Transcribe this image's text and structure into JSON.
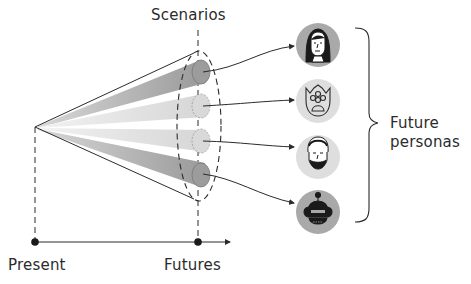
{
  "labels": {
    "scenarios": "Scenarios",
    "present": "Present",
    "futures": "Futures",
    "future_personas_line1": "Future",
    "future_personas_line2": "personas"
  },
  "personas": [
    {
      "name": "woman-long-hair",
      "icon": "woman-avatar-icon",
      "bg": "#a9a9a9"
    },
    {
      "name": "creature-three-eyes",
      "icon": "monster-avatar-icon",
      "bg": "#dedede"
    },
    {
      "name": "bearded-man",
      "icon": "man-avatar-icon",
      "bg": "#dedede"
    },
    {
      "name": "robot",
      "icon": "robot-avatar-icon",
      "bg": "#a9a9a9"
    }
  ],
  "scenarios": [
    {
      "index": 1,
      "shade": "dark",
      "color": "#9c9c9c"
    },
    {
      "index": 2,
      "shade": "light",
      "color": "#d9d9d9"
    },
    {
      "index": 3,
      "shade": "light",
      "color": "#d9d9d9"
    },
    {
      "index": 4,
      "shade": "dark",
      "color": "#9c9c9c"
    }
  ],
  "colors": {
    "line": "#2b2b2b",
    "dark_beam": "#9c9c9c",
    "light_beam": "#d9d9d9",
    "background": "#ffffff"
  }
}
